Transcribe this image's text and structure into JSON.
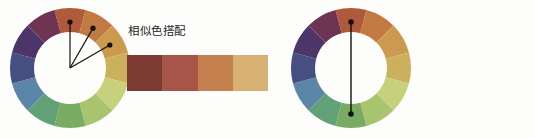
{
  "canvas": {
    "width": 534,
    "height": 138,
    "background": "#fdfdfb"
  },
  "wheel": {
    "segment_count": 12,
    "outer_radius": 60,
    "inner_radius": 36,
    "segments": [
      {
        "index": 0,
        "name": "red-orange",
        "color": "#b05a3c"
      },
      {
        "index": 1,
        "name": "orange",
        "color": "#c07a42"
      },
      {
        "index": 2,
        "name": "amber",
        "color": "#cc9a4e"
      },
      {
        "index": 3,
        "name": "gold",
        "color": "#cdb05e"
      },
      {
        "index": 4,
        "name": "yellow-green",
        "color": "#c7d07a"
      },
      {
        "index": 5,
        "name": "light-green",
        "color": "#a9c46e"
      },
      {
        "index": 6,
        "name": "green",
        "color": "#7aab63"
      },
      {
        "index": 7,
        "name": "teal-green",
        "color": "#62a178"
      },
      {
        "index": 8,
        "name": "steel-blue",
        "color": "#5b86a8"
      },
      {
        "index": 9,
        "name": "indigo-blue",
        "color": "#464f80"
      },
      {
        "index": 10,
        "name": "violet",
        "color": "#4b3569"
      },
      {
        "index": 11,
        "name": "plum",
        "color": "#6d3553"
      },
      {
        "index": 12,
        "name": "maroon",
        "color": "#8b3a3f"
      },
      {
        "index": 13,
        "name": "brick",
        "color": "#a04a3e"
      }
    ]
  },
  "panels": [
    {
      "id": "analogous",
      "title": "相似色搭配",
      "marker_type": "fan",
      "marker_description": "three lines from wheel center to three adjacent segments",
      "marked_segments": [
        0,
        1,
        2
      ],
      "swatches": [
        {
          "name": "dark-maroon",
          "color": "#7b3a32"
        },
        {
          "name": "brick-red",
          "color": "#a65548"
        },
        {
          "name": "terracotta",
          "color": "#c4804f"
        },
        {
          "name": "tan-gold",
          "color": "#d7b172"
        }
      ]
    },
    {
      "id": "complementary",
      "title": "互补色搭配",
      "marker_type": "chord",
      "marker_description": "vertical line joining two opposite segments",
      "marked_segments": [
        0,
        6
      ],
      "swatches_top": [
        {
          "name": "light-brick-red",
          "color": "#b85b52"
        },
        {
          "name": "dark-brick-red",
          "color": "#9e4540"
        },
        {
          "name": "medium-green",
          "color": "#6d9f66"
        },
        {
          "name": "light-green",
          "color": "#8fb484"
        }
      ],
      "swatches_bottom": [
        {
          "name": "dusty-rose",
          "color": "#bd6f68"
        },
        {
          "name": "dark-forest",
          "color": "#39403a"
        },
        {
          "name": "sage-green",
          "color": "#96b39c"
        },
        {
          "name": "pale-mint",
          "color": "#cfe0d0"
        }
      ],
      "arrow": {
        "name": "downward-arrow",
        "color": "#1a1a1a"
      }
    }
  ]
}
